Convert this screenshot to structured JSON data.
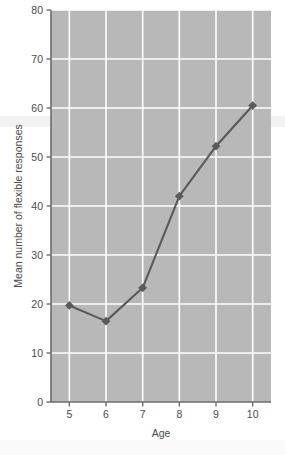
{
  "figure": {
    "background_color": "#ffffff",
    "plot_background_color": "#b8b8b8",
    "gridline_color": "#ffffff",
    "axis_color": "#6b6b6b",
    "series_color": "#5a5a5a",
    "marker_shape": "diamond"
  },
  "chart_data": {
    "type": "line",
    "title": "",
    "xlabel": "Age",
    "ylabel": "Mean number of flexible responses",
    "x": [
      5,
      6,
      7,
      8,
      9,
      10
    ],
    "values": [
      19.7,
      16.5,
      23.3,
      42.0,
      52.2,
      60.5
    ],
    "xlim": [
      4.5,
      10.5
    ],
    "ylim": [
      0,
      80
    ],
    "xticks": [
      5,
      6,
      7,
      8,
      9,
      10
    ],
    "yticks": [
      0,
      10,
      20,
      30,
      40,
      50,
      60,
      70,
      80
    ],
    "xtick_labels": [
      "5",
      "6",
      "7",
      "8",
      "9",
      "10"
    ],
    "ytick_labels": [
      "0",
      "10",
      "20",
      "30",
      "40",
      "50",
      "60",
      "70",
      "80"
    ],
    "grid": true,
    "legend": false,
    "marker": "diamond",
    "series": [
      {
        "name": "Mean number of flexible responses",
        "values": [
          19.7,
          16.5,
          23.3,
          42.0,
          52.2,
          60.5
        ]
      }
    ]
  }
}
